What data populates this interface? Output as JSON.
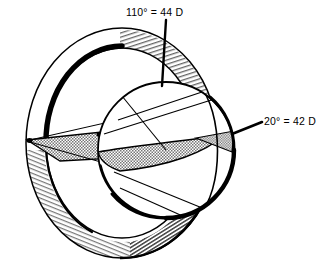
{
  "figure": {
    "name": "corneal-meridian-diagram",
    "background_color": "#ffffff",
    "ink_color": "#000000",
    "shading_color": "#9a9a9a",
    "width": 319,
    "height": 272
  },
  "annotations": [
    {
      "id": "steep-meridian",
      "label": "110° = 44 D",
      "angle_deg": 110,
      "power_diopters": 44,
      "position": "top",
      "leader": {
        "x1": 166,
        "y1": 20,
        "x2": 162,
        "y2": 86
      }
    },
    {
      "id": "flat-meridian",
      "label": "20° = 42 D",
      "angle_deg": 20,
      "power_diopters": 42,
      "position": "right",
      "leader": {
        "x1": 232,
        "y1": 134,
        "x2": 262,
        "y2": 122
      }
    }
  ],
  "geometry": {
    "outer_ring": {
      "name": "outer-torus-ring",
      "center_x": 122,
      "center_y": 143,
      "radius_x": 96,
      "radius_y": 115
    },
    "inner_sphere": {
      "name": "inner-sphere",
      "center_x": 166,
      "center_y": 150,
      "radius": 68
    },
    "lens_wedge": {
      "name": "shaded-meridian-band",
      "left_tip_x": 26,
      "left_tip_y": 140,
      "right_tip_x": 232,
      "right_tip_y": 133
    }
  }
}
